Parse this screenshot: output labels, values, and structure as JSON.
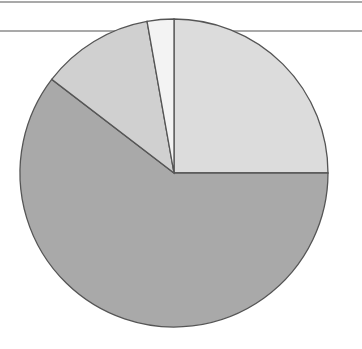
{
  "chart_data": {
    "type": "pie",
    "title": "",
    "start_angle": "12 o'clock",
    "direction": "clockwise",
    "slices": [
      {
        "label": "",
        "value": 25.0,
        "color": "#dcdcdc"
      },
      {
        "label": "",
        "value": 60.4,
        "color": "#a9a9a9"
      },
      {
        "label": "",
        "value": 11.8,
        "color": "#d0d0d0"
      },
      {
        "label": "",
        "value": 2.8,
        "color": "#f3f3f3"
      }
    ],
    "legend": "none",
    "center": [
      174,
      173
    ],
    "radius": 154,
    "stroke_color": "#555555"
  },
  "frame": {
    "line_color": "#555555",
    "top_line_y": 2,
    "mid_line_y": 31
  }
}
